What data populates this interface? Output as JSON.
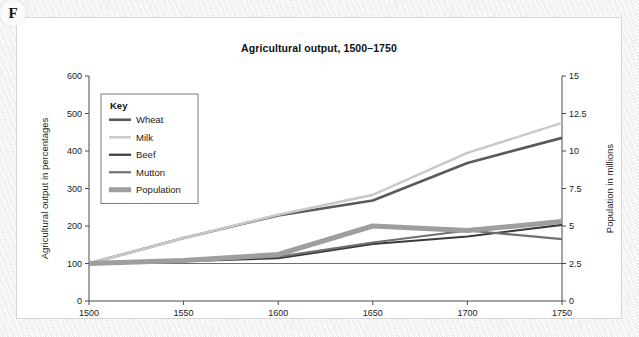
{
  "figure": {
    "badge_letter": "F"
  },
  "chart_data": {
    "type": "line",
    "title": "Agricultural output, 1500–1750",
    "xlabel": "",
    "ylabel": "Agricultural output in percentages",
    "y2label": "Population in millions",
    "x": [
      1500,
      1550,
      1600,
      1650,
      1700,
      1750
    ],
    "xticklabels": [
      "1500",
      "1550",
      "1600",
      "1650",
      "1700",
      "1750"
    ],
    "xlim": [
      1500,
      1750
    ],
    "ylim": [
      0,
      600
    ],
    "yticks": [
      0,
      100,
      200,
      300,
      400,
      500,
      600
    ],
    "yticklabels": [
      "0",
      "100",
      "200",
      "300",
      "400",
      "500",
      "600"
    ],
    "y2lim": [
      0,
      15
    ],
    "y2ticks": [
      0,
      2.5,
      5,
      7.5,
      10,
      12.5,
      15
    ],
    "y2ticklabels": [
      "0",
      "2.5",
      "5",
      "7.5",
      "10",
      "12.5",
      "15"
    ],
    "grid": false,
    "legend_position": "upper-left",
    "legend_title": "Key",
    "series": [
      {
        "name": "Wheat",
        "axis": "left",
        "color": "#5a5a5a",
        "width": 2.6,
        "values": [
          100,
          168,
          228,
          268,
          368,
          435
        ]
      },
      {
        "name": "Milk",
        "axis": "left",
        "color": "#c9c9c9",
        "width": 2.6,
        "values": [
          100,
          168,
          230,
          283,
          395,
          475
        ]
      },
      {
        "name": "Beef",
        "axis": "left",
        "color": "#3a3a3a",
        "width": 2.2,
        "values": [
          100,
          106,
          114,
          152,
          172,
          203
        ]
      },
      {
        "name": "Mutton",
        "axis": "left",
        "color": "#707070",
        "width": 2.2,
        "values": [
          100,
          107,
          118,
          156,
          188,
          165
        ]
      },
      {
        "name": "Population",
        "axis": "right",
        "color": "#9e9e9e",
        "width": 5.0,
        "values": [
          2.5,
          2.7,
          3.1,
          5.0,
          4.7,
          5.3
        ],
        "values_left_scale": [
          100,
          108,
          125,
          200,
          188,
          212
        ]
      }
    ]
  }
}
